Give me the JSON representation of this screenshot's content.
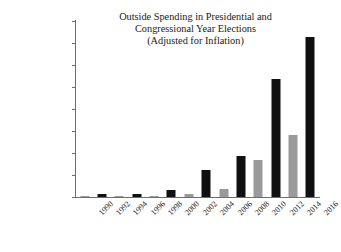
{
  "chart_data": {
    "type": "bar",
    "title": "Outside Spending in Presidential and Congressional Year Elections (Adjusted for Inflation)",
    "title_lines": [
      "Outside Spending in Presidential and",
      "Congressional Year Elections",
      "(Adjusted for Inflation)"
    ],
    "xlabel": "",
    "ylabel": "",
    "grid": false,
    "legend": "none",
    "ylim": [
      0,
      1600000000
    ],
    "ytick_values": [
      0,
      200000000,
      400000000,
      600000000,
      800000000,
      1000000000,
      1200000000,
      1400000000,
      1600000000
    ],
    "ytick_labels": [
      "$0",
      "$200,000,000",
      "$400,000,000",
      "$600,000,000",
      "$800,000,000",
      "$1,000,000,000",
      "$1,200,000,000",
      "$1,400,000,000",
      "$1,600,000,000"
    ],
    "categories": [
      "1990",
      "1992",
      "1994",
      "1996",
      "1998",
      "2000",
      "2002",
      "2004",
      "2006",
      "2008",
      "2010",
      "2012",
      "2014",
      "2016"
    ],
    "values": [
      5000000,
      28000000,
      4000000,
      24000000,
      13000000,
      64000000,
      30000000,
      242000000,
      75000000,
      372000000,
      336000000,
      1076000000,
      560000000,
      1455000000
    ],
    "bar_colors": [
      "gray",
      "black",
      "gray",
      "black",
      "gray",
      "black",
      "gray",
      "black",
      "gray",
      "black",
      "gray",
      "black",
      "gray",
      "black"
    ],
    "series": [
      {
        "name": "Outside Spending",
        "points": [
          {
            "year": "1990",
            "value": 5000000,
            "type": "congressional",
            "color": "gray"
          },
          {
            "year": "1992",
            "value": 28000000,
            "type": "presidential",
            "color": "black"
          },
          {
            "year": "1994",
            "value": 4000000,
            "type": "congressional",
            "color": "gray"
          },
          {
            "year": "1996",
            "value": 24000000,
            "type": "presidential",
            "color": "black"
          },
          {
            "year": "1998",
            "value": 13000000,
            "type": "congressional",
            "color": "gray"
          },
          {
            "year": "2000",
            "value": 64000000,
            "type": "presidential",
            "color": "black"
          },
          {
            "year": "2002",
            "value": 30000000,
            "type": "congressional",
            "color": "gray"
          },
          {
            "year": "2004",
            "value": 242000000,
            "type": "presidential",
            "color": "black"
          },
          {
            "year": "2006",
            "value": 75000000,
            "type": "congressional",
            "color": "gray"
          },
          {
            "year": "2008",
            "value": 372000000,
            "type": "presidential",
            "color": "black"
          },
          {
            "year": "2010",
            "value": 336000000,
            "type": "congressional",
            "color": "gray"
          },
          {
            "year": "2012",
            "value": 1076000000,
            "type": "presidential",
            "color": "black"
          },
          {
            "year": "2014",
            "value": 560000000,
            "type": "congressional",
            "color": "gray"
          },
          {
            "year": "2016",
            "value": 1455000000,
            "type": "presidential",
            "color": "black"
          }
        ]
      }
    ],
    "colors": {
      "presidential_bar": "#101010",
      "congressional_bar": "#9a9a9a",
      "axis": "#6d6d6d",
      "text": "#1a1a1a",
      "background": "#ffffff"
    }
  }
}
